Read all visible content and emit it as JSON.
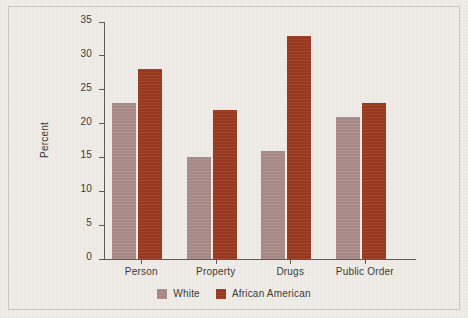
{
  "chart_data": {
    "type": "bar",
    "title": "",
    "subtitle": "",
    "xlabel": "",
    "ylabel": "Percent",
    "categories": [
      "Person",
      "Property",
      "Drugs",
      "Public Order"
    ],
    "series": [
      {
        "name": "White",
        "values": [
          23,
          15,
          16,
          21
        ],
        "color": "#ab8d8a"
      },
      {
        "name": "African American",
        "values": [
          28,
          22,
          33,
          23
        ],
        "color": "#9c3a22"
      }
    ],
    "ylim": [
      0,
      35
    ],
    "ytick_labels": [
      "0",
      "5",
      "10",
      "15",
      "20",
      "25",
      "30",
      "35"
    ],
    "ytick_values": [
      0,
      5,
      10,
      15,
      20,
      25,
      30,
      35
    ],
    "grid": false,
    "legend_position": "bottom-center",
    "background_color": "#efece7",
    "axis_color": "#5c5a57"
  },
  "legend": {
    "items": [
      {
        "label": "White",
        "swatch_name": "legend-swatch-white"
      },
      {
        "label": "African American",
        "swatch_name": "legend-swatch-african-american"
      }
    ]
  }
}
